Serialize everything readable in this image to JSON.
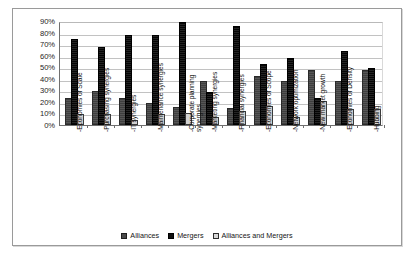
{
  "chart_data": {
    "type": "bar",
    "title": "",
    "subtitle": "",
    "xlabel": "",
    "ylabel": "",
    "ylim": [
      0,
      90
    ],
    "ytick_labels": [
      "90%",
      "80%",
      "70%",
      "60%",
      "50%",
      "40%",
      "30%",
      "20%",
      "10%",
      "0%"
    ],
    "ytick_values": [
      90,
      80,
      70,
      60,
      50,
      40,
      30,
      20,
      10,
      0
    ],
    "grid": true,
    "legend_position": "bottom",
    "categories": [
      "-Economies of Scale",
      "-Purchasing synergies",
      "-IT synergies",
      "-Maintenance synergies",
      "-Corporate planning synergies",
      "-Marketing synergies",
      "-Financial synergies",
      "-Economies of Scope",
      "-Network optimization",
      "-New market growth",
      "-Economies of Density",
      "-Hubbing"
    ],
    "series": [
      {
        "name": "Alliances",
        "color": "#4a4a4a",
        "values": [
          22,
          28,
          22,
          17,
          14,
          36,
          13,
          41,
          36,
          46,
          36,
          46
        ]
      },
      {
        "name": "Mergers",
        "color": "#101010",
        "values": [
          73,
          66,
          76,
          76,
          87,
          27,
          84,
          51,
          56,
          22,
          62,
          48
        ]
      },
      {
        "name": "Alliances and Mergers",
        "color": "#d8d8d8",
        "values": [
          8,
          8,
          3,
          8,
          9,
          5,
          10,
          15,
          5,
          19,
          12,
          12
        ]
      }
    ]
  },
  "legend": {
    "items": [
      {
        "label": "Alliances",
        "swatch": "alliances"
      },
      {
        "label": "Mergers",
        "swatch": "mergers"
      },
      {
        "label": "Alliances and Mergers",
        "swatch": "both"
      }
    ]
  }
}
